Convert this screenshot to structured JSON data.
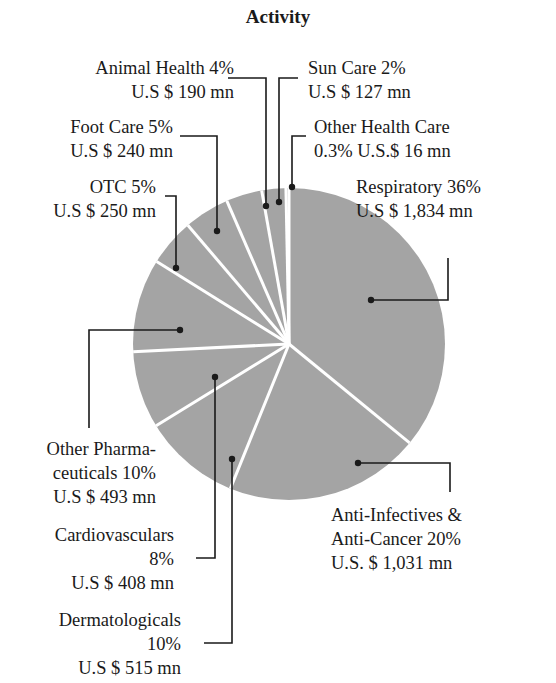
{
  "chart_data": {
    "type": "pie",
    "title": "Activity",
    "unit": "U.S $ mn",
    "slice_color": "#a4a4a4",
    "separator_color": "#ffffff",
    "slices": [
      {
        "name": "Respiratory",
        "percent": 36,
        "value": 1834,
        "pct_label": "36%",
        "value_label": "U.S $ 1,834 mn"
      },
      {
        "name": "Anti-Infectives & Anti-Cancer",
        "percent": 20,
        "value": 1031,
        "pct_label": "20%",
        "value_label": "U.S. $ 1,031 mn"
      },
      {
        "name": "Dermatologicals",
        "percent": 10,
        "value": 515,
        "pct_label": "10%",
        "value_label": "U.S $ 515 mn"
      },
      {
        "name": "Cardiovasculars",
        "percent": 8,
        "value": 408,
        "pct_label": "8%",
        "value_label": "U.S $ 408 mn"
      },
      {
        "name": "Other Pharmaceuticals",
        "percent": 10,
        "value": 493,
        "pct_label": "10%",
        "value_label": "U.S $ 493 mn"
      },
      {
        "name": "OTC",
        "percent": 5,
        "value": 250,
        "pct_label": "5%",
        "value_label": "U.S $ 250 mn"
      },
      {
        "name": "Foot Care",
        "percent": 5,
        "value": 240,
        "pct_label": "5%",
        "value_label": "U.S $ 240 mn"
      },
      {
        "name": "Animal Health",
        "percent": 4,
        "value": 190,
        "pct_label": "4%",
        "value_label": "U.S $ 190 mn"
      },
      {
        "name": "Sun Care",
        "percent": 2,
        "value": 127,
        "pct_label": "2%",
        "value_label": "U.S $ 127 mn"
      },
      {
        "name": "Other Health Care",
        "percent": 0.3,
        "value": 16,
        "pct_label": "0.3%",
        "value_label": "U.S.$ 16 mn"
      }
    ],
    "legend": "none (callout labels with leader lines)"
  },
  "labels": {
    "title": "Activity",
    "animal_health": {
      "line1": "Animal Health  4%",
      "line2": "U.S $ 190 mn"
    },
    "sun_care": {
      "line1": "Sun Care  2%",
      "line2": "U.S $ 127 mn"
    },
    "foot_care": {
      "line1": "Foot Care  5%",
      "line2": "U.S $ 240 mn"
    },
    "other_health_care": {
      "line1": "Other Health Care",
      "line2": "0.3%   U.S.$ 16 mn"
    },
    "otc": {
      "line1": "OTC  5%",
      "line2": "U.S $ 250 mn"
    },
    "respiratory": {
      "line1": "Respiratory 36%",
      "line2": "U.S $ 1,834 mn"
    },
    "other_pharma": {
      "line1": "Other Pharma-",
      "line2": "ceuticals  10%",
      "line3": "U.S $ 493 mn"
    },
    "anti_infectives": {
      "line1": "Anti-Infectives &",
      "line2": "Anti-Cancer  20%",
      "line3": "U.S. $ 1,031 mn"
    },
    "cardiovasculars": {
      "line1": "Cardiovasculars",
      "line2": "8%",
      "line3": "U.S $ 408 mn"
    },
    "dermatologicals": {
      "line1": "Dermatologicals",
      "line2": "10%",
      "line3": "U.S $ 515 mn"
    }
  }
}
